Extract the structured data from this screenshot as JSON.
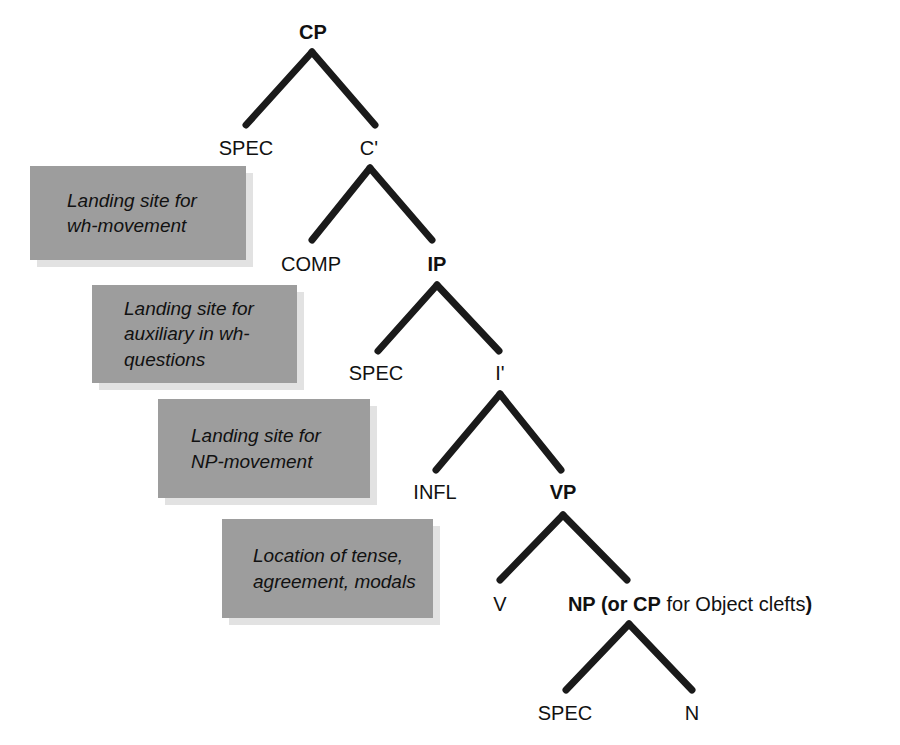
{
  "diagram": {
    "background_color": "#ffffff",
    "line_color": "#1a1a1a",
    "callout_fill_color": "#9d9d9d",
    "callout_shadow_color": "#e2e2e2",
    "text_color": "#111111"
  },
  "nodes": {
    "cp": "CP",
    "spec_cp": "SPEC",
    "c_bar": "C'",
    "comp": "COMP",
    "ip": "IP",
    "spec_ip": "SPEC",
    "i_bar": "I'",
    "infl": "INFL",
    "vp": "VP",
    "v": "V",
    "np_bold_1": "NP (or ",
    "np_bold_2": "CP",
    "np_regular": " for Object clefts",
    "np_bold_3": ")",
    "spec_np": "SPEC",
    "n": "N"
  },
  "callouts": [
    {
      "id": "landing-site-wh-movement",
      "text": "Landing site for\nwh-movement"
    },
    {
      "id": "landing-site-auxiliary",
      "text": "Landing site for\nauxiliary in wh-\nquestions"
    },
    {
      "id": "landing-site-np-movement",
      "text": "Landing site for\nNP-movement"
    },
    {
      "id": "location-of-tense",
      "text": "Location of tense,\nagreement, modals"
    }
  ]
}
